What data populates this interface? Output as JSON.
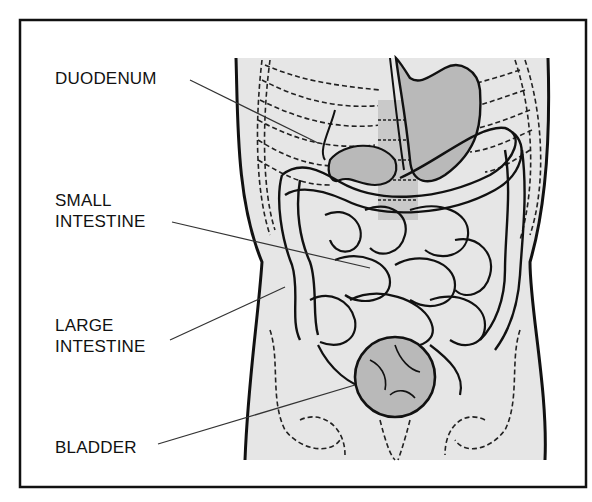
{
  "diagram": {
    "colors": {
      "frame": "#111111",
      "body_fill": "#e6e6e6",
      "organ_fill": "#b9b9b9",
      "outline": "#111111",
      "leader_line": "#333333"
    },
    "labels": [
      {
        "id": "duodenum",
        "text": "DUODENUM",
        "x": 55,
        "y": 68,
        "pointer": [
          318,
          143
        ]
      },
      {
        "id": "small-intestine",
        "text": "SMALL\nINTESTINE",
        "x": 55,
        "y": 190,
        "pointer": [
          370,
          268
        ]
      },
      {
        "id": "large-intestine",
        "text": "LARGE\nINTESTINE",
        "x": 55,
        "y": 315,
        "pointer": [
          285,
          287
        ]
      },
      {
        "id": "bladder",
        "text": "BLADDER",
        "x": 55,
        "y": 437,
        "pointer": [
          355,
          385
        ]
      }
    ]
  }
}
